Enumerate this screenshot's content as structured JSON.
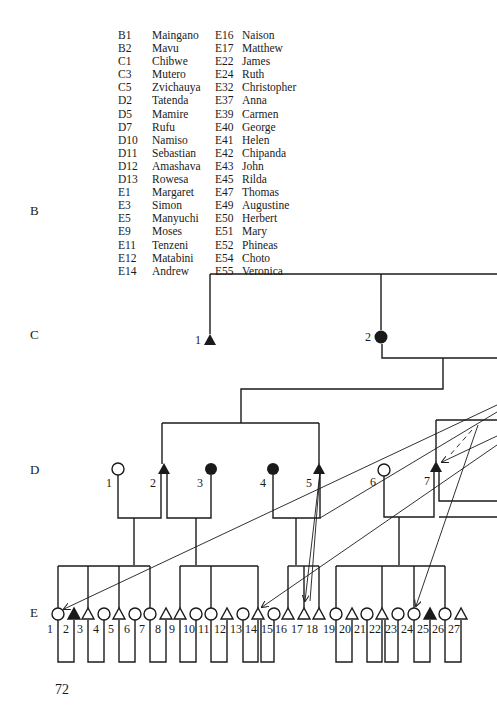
{
  "legend": {
    "left": [
      {
        "code": "B1",
        "name": "Maingano"
      },
      {
        "code": "B2",
        "name": "Mavu"
      },
      {
        "code": "C1",
        "name": "Chibwe"
      },
      {
        "code": "C3",
        "name": "Mutero"
      },
      {
        "code": "C5",
        "name": "Zvichauya"
      },
      {
        "code": "D2",
        "name": "Tatenda"
      },
      {
        "code": "D5",
        "name": "Mamire"
      },
      {
        "code": "D7",
        "name": "Rufu"
      },
      {
        "code": "D10",
        "name": "Namiso"
      },
      {
        "code": "D11",
        "name": "Sebastian"
      },
      {
        "code": "D12",
        "name": "Amashava"
      },
      {
        "code": "D13",
        "name": "Rowesa"
      },
      {
        "code": "E1",
        "name": "Margaret"
      },
      {
        "code": "E3",
        "name": "Simon"
      },
      {
        "code": "E5",
        "name": "Manyuchi"
      },
      {
        "code": "E9",
        "name": "Moses"
      },
      {
        "code": "E11",
        "name": "Tenzeni"
      },
      {
        "code": "E12",
        "name": "Matabini"
      },
      {
        "code": "E14",
        "name": "Andrew"
      }
    ],
    "right": [
      {
        "code": "E16",
        "name": "Naison"
      },
      {
        "code": "E17",
        "name": "Matthew"
      },
      {
        "code": "E22",
        "name": "James"
      },
      {
        "code": "E24",
        "name": "Ruth"
      },
      {
        "code": "E32",
        "name": "Christopher"
      },
      {
        "code": "E37",
        "name": "Anna"
      },
      {
        "code": "E39",
        "name": "Carmen"
      },
      {
        "code": "E40",
        "name": "George"
      },
      {
        "code": "E41",
        "name": "Helen"
      },
      {
        "code": "E42",
        "name": "Chipanda"
      },
      {
        "code": "E43",
        "name": "John"
      },
      {
        "code": "E45",
        "name": "Rilda"
      },
      {
        "code": "E47",
        "name": "Thomas"
      },
      {
        "code": "E49",
        "name": "Augustine"
      },
      {
        "code": "E50",
        "name": "Herbert"
      },
      {
        "code": "E51",
        "name": "Mary"
      },
      {
        "code": "E52",
        "name": "Phineas"
      },
      {
        "code": "E54",
        "name": "Choto"
      },
      {
        "code": "E55",
        "name": "Veronica"
      }
    ]
  },
  "generations": {
    "B": "B",
    "C": "C",
    "D": "D",
    "E": "E"
  },
  "nodes": {
    "C": [
      {
        "num": "1",
        "shape": "triangle",
        "filled": true
      },
      {
        "num": "2",
        "shape": "circle",
        "filled": true
      }
    ],
    "D": [
      {
        "num": "1",
        "shape": "circle",
        "filled": false
      },
      {
        "num": "2",
        "shape": "triangle",
        "filled": true
      },
      {
        "num": "3",
        "shape": "circle",
        "filled": true
      },
      {
        "num": "4",
        "shape": "circle",
        "filled": true
      },
      {
        "num": "5",
        "shape": "triangle",
        "filled": true
      },
      {
        "num": "6",
        "shape": "circle",
        "filled": false
      },
      {
        "num": "7",
        "shape": "triangle",
        "filled": true
      }
    ],
    "E": [
      {
        "num": "1",
        "shape": "circle",
        "filled": false
      },
      {
        "num": "2",
        "shape": "triangle",
        "filled": true
      },
      {
        "num": "3",
        "shape": "triangle",
        "filled": false
      },
      {
        "num": "4",
        "shape": "circle",
        "filled": false
      },
      {
        "num": "5",
        "shape": "triangle",
        "filled": false
      },
      {
        "num": "6",
        "shape": "circle",
        "filled": false
      },
      {
        "num": "7",
        "shape": "circle",
        "filled": false
      },
      {
        "num": "8",
        "shape": "triangle",
        "filled": false
      },
      {
        "num": "9",
        "shape": "triangle",
        "filled": false
      },
      {
        "num": "10",
        "shape": "circle",
        "filled": false
      },
      {
        "num": "11",
        "shape": "circle",
        "filled": false
      },
      {
        "num": "12",
        "shape": "triangle",
        "filled": false
      },
      {
        "num": "13",
        "shape": "circle",
        "filled": false
      },
      {
        "num": "14",
        "shape": "triangle",
        "filled": false
      },
      {
        "num": "15",
        "shape": "circle",
        "filled": false
      },
      {
        "num": "16",
        "shape": "triangle",
        "filled": false
      },
      {
        "num": "17",
        "shape": "triangle",
        "filled": false
      },
      {
        "num": "18",
        "shape": "triangle",
        "filled": false
      },
      {
        "num": "19",
        "shape": "circle",
        "filled": false
      },
      {
        "num": "20",
        "shape": "triangle",
        "filled": false
      },
      {
        "num": "21",
        "shape": "circle",
        "filled": false
      },
      {
        "num": "22",
        "shape": "triangle",
        "filled": false
      },
      {
        "num": "23",
        "shape": "circle",
        "filled": false
      },
      {
        "num": "24",
        "shape": "circle",
        "filled": false
      },
      {
        "num": "25",
        "shape": "triangle",
        "filled": true
      },
      {
        "num": "26",
        "shape": "circle",
        "filled": false
      },
      {
        "num": "27",
        "shape": "triangle",
        "filled": false
      }
    ]
  },
  "page_number": "72",
  "colors": {
    "ink": "#1a1a1a",
    "paper": "#ffffff"
  }
}
